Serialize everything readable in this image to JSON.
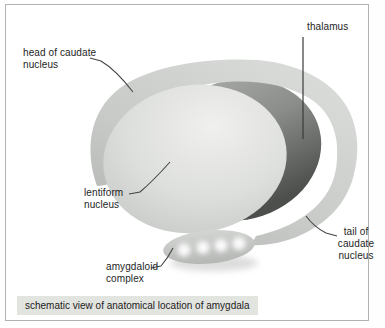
{
  "figure": {
    "caption": "schematic view of anatomical location of amygdala",
    "labels": {
      "head_caudate": {
        "line1": "head of caudate",
        "line2": "nucleus"
      },
      "thalamus": {
        "line1": "thalamus"
      },
      "lentiform": {
        "line1": "lentiform",
        "line2": "nucleus"
      },
      "amygdaloid": {
        "line1": "amygdaloid",
        "line2": "complex"
      },
      "tail_caudate": {
        "line1": "tail of",
        "line2": "caudate",
        "line3": "nucleus"
      }
    },
    "colors": {
      "caudate_band_light": "#d9dbd9",
      "caudate_band_dark": "#b0b2b0",
      "thalamus_light": "#a5a7a5",
      "thalamus_dark": "#4f514f",
      "lentiform_light": "#f0f0ee",
      "lentiform_edge": "#c2c4c2",
      "amygdala_fill": "#c6c8c6",
      "amygdala_dots": "#ffffff",
      "caption_bg": "#e2e4e0",
      "frame_border": "#b1b3b1",
      "leader_line": "#444444",
      "text": "#1e1e1e"
    }
  }
}
